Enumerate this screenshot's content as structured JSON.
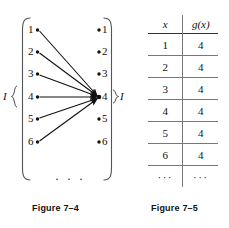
{
  "figure_diagram": {
    "caption": "Figure 7–4",
    "domain_label": "I",
    "codomain_label": "I",
    "domain_nodes": [
      "1",
      "2",
      "3",
      "4",
      "5",
      "6"
    ],
    "codomain_nodes": [
      "1",
      "2",
      "3",
      "4",
      "5",
      "6"
    ],
    "ellipsis": "· · ·",
    "arrow_target_node": "4",
    "arrows": [
      {
        "from": "1",
        "to": "4"
      },
      {
        "from": "2",
        "to": "4"
      },
      {
        "from": "3",
        "to": "4"
      },
      {
        "from": "4",
        "to": "4"
      },
      {
        "from": "5",
        "to": "4"
      },
      {
        "from": "6",
        "to": "4"
      }
    ],
    "ink_color": "#111111"
  },
  "figure_table": {
    "caption": "Figure 7–5",
    "headers": [
      "x",
      "g(x)"
    ],
    "rows": [
      [
        "1",
        "4"
      ],
      [
        "2",
        "4"
      ],
      [
        "3",
        "4"
      ],
      [
        "4",
        "4"
      ],
      [
        "5",
        "4"
      ],
      [
        "6",
        "4"
      ],
      [
        "···",
        "···"
      ]
    ],
    "rule_color": "#777777"
  }
}
